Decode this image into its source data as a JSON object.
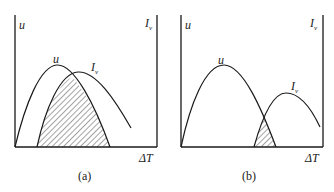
{
  "panels": [
    {
      "id": "a",
      "caption": "(a)",
      "y_axis_left_label": "u",
      "y_axis_right_label": "I",
      "y_axis_right_sub": "v",
      "x_axis_label": "ΔT",
      "curve1_label": "u",
      "curve2_label": "I",
      "curve2_sub": "v",
      "description": "Large overlap of u and I_v curves; shaded region under both curves is large"
    },
    {
      "id": "b",
      "caption": "(b)",
      "y_axis_left_label": "u",
      "y_axis_right_label": "I",
      "y_axis_right_sub": "v",
      "x_axis_label": "ΔT",
      "curve1_label": "u",
      "curve2_label": "I",
      "curve2_sub": "v",
      "description": "Small overlap of u and I_v curves; shaded region under both curves is small"
    }
  ],
  "colors": {
    "line": "#1a1a1a",
    "hatch": "#333333",
    "background": "#ffffff"
  }
}
